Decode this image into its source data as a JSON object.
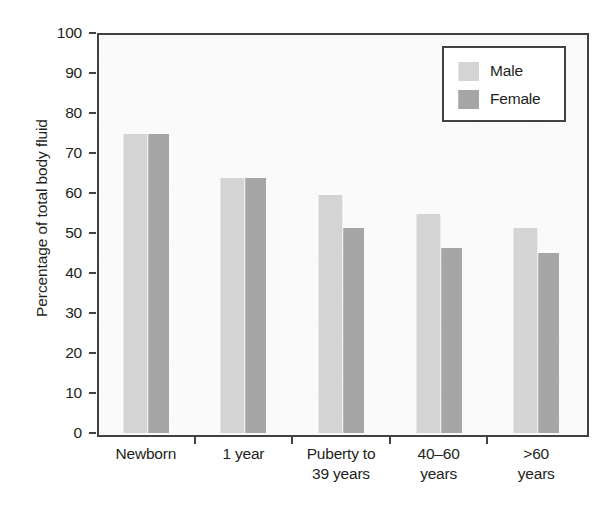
{
  "chart_data": {
    "type": "bar",
    "title": "",
    "xlabel": "",
    "ylabel": "Percentage of total body fluid",
    "ylim": [
      0,
      100
    ],
    "yticks": [
      0,
      10,
      20,
      30,
      40,
      50,
      60,
      70,
      80,
      90,
      100
    ],
    "ytick_labels": [
      "0",
      "10",
      "20",
      "30",
      "40",
      "50",
      "60",
      "70",
      "80",
      "90",
      "100"
    ],
    "grid": false,
    "legend_position": "top-right",
    "categories": [
      {
        "line1": "Newborn",
        "line2": ""
      },
      {
        "line1": "1 year",
        "line2": ""
      },
      {
        "line1": "Puberty to",
        "line2": "39 years"
      },
      {
        "line1": "40–60",
        "line2": "years"
      },
      {
        "line1": ">60",
        "line2": "years"
      }
    ],
    "category_labels": [
      "Newborn",
      "1 year",
      "Puberty to 39 years",
      "40–60 years",
      ">60 years"
    ],
    "series": [
      {
        "name": "Male",
        "color": "#d4d4d4",
        "values": [
          74.7,
          63.7,
          59.6,
          54.7,
          51.2
        ]
      },
      {
        "name": "Female",
        "color": "#a6a6a6",
        "values": [
          74.7,
          63.7,
          51.3,
          46.3,
          45.0
        ]
      }
    ],
    "legend": [
      {
        "label": "Male",
        "swatch": "male-swatch",
        "color": "#d4d4d4"
      },
      {
        "label": "Female",
        "swatch": "female-swatch",
        "color": "#a6a6a6"
      }
    ],
    "axis_color": "#414042",
    "plot_background": "#fafafa"
  }
}
